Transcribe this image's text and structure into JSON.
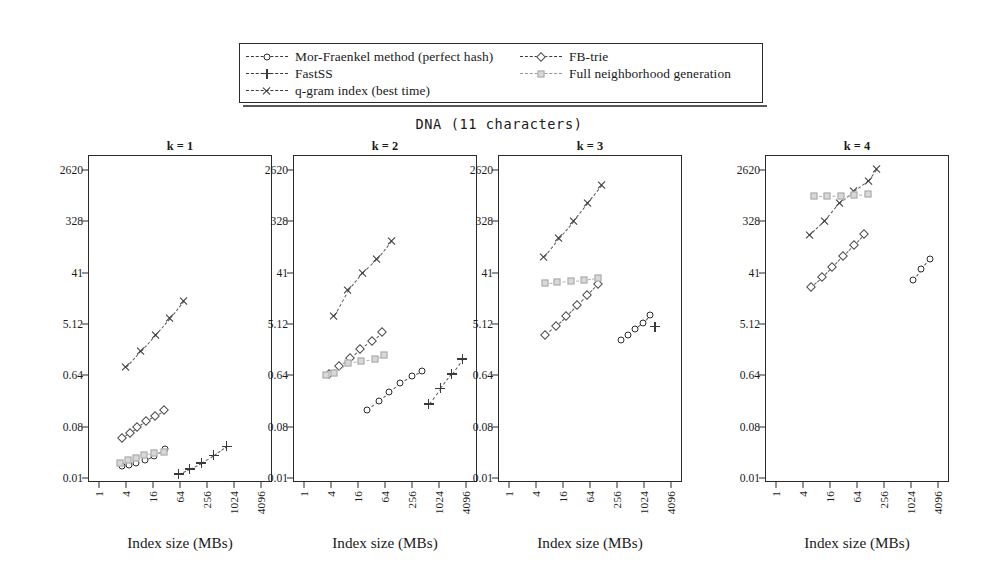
{
  "figure": {
    "title": "DNA (11 characters)",
    "xlabel": "Index size (MBs)"
  },
  "legend": {
    "entries_left": [
      {
        "label": "Mor-Fraenkel method (perfect hash)",
        "marker": "circle-marker",
        "line": "dashed-dark"
      },
      {
        "label": "FastSS",
        "marker": "plus-marker",
        "line": "dashed-dark"
      },
      {
        "label": "q-gram index (best time)",
        "marker": "cross-marker",
        "line": "dashed-dark"
      }
    ],
    "entries_right": [
      {
        "label": "FB-trie",
        "marker": "diamond-marker",
        "line": "dashed-dark"
      },
      {
        "label": "Full neighborhood generation",
        "marker": "square-marker",
        "line": "dashed-gray"
      }
    ]
  },
  "axes": {
    "y_ticks": [
      "2620",
      "328",
      "41",
      "5.12",
      "0.64",
      "0.08",
      "0.01"
    ],
    "y_values": [
      2620,
      328,
      41,
      5.12,
      0.64,
      0.08,
      0.01
    ],
    "x_ticks": [
      "1",
      "4",
      "16",
      "64",
      "256",
      "1024",
      "4096"
    ],
    "x_values": [
      1,
      4,
      16,
      64,
      256,
      1024,
      4096
    ]
  },
  "colors": {
    "frame": "#2b2b2b",
    "dark_series": "#3a3a3a",
    "gray_series": "#a8a8a8",
    "gray_fill": "#d8d8d8",
    "background": "#ffffff"
  },
  "chart_data": {
    "type": "scatter",
    "title": "DNA (11 characters)",
    "xlabel": "Index size (MBs)",
    "ylabel": "",
    "xscale": "log",
    "yscale": "log",
    "xlim": [
      1,
      4096
    ],
    "ylim": [
      0.01,
      2620
    ],
    "grid": false,
    "legend_position": "top-center",
    "panels": [
      {
        "label": "k = 1",
        "series": [
          {
            "name": "Mor-Fraenkel method (perfect hash)",
            "marker": "circle",
            "x": [
              3.2,
              4.6,
              6.8,
              10.5,
              17.0,
              30.0
            ],
            "y": [
              0.0165,
              0.017,
              0.0185,
              0.0205,
              0.0245,
              0.033
            ]
          },
          {
            "name": "FastSS",
            "marker": "plus",
            "x": [
              60.0,
              105.0,
              190.0,
              360.0,
              700.0
            ],
            "y": [
              0.0118,
              0.0145,
              0.0185,
              0.025,
              0.036
            ]
          },
          {
            "name": "q-gram index (best time)",
            "marker": "cross",
            "x": [
              4.0,
              8.5,
              18.0,
              38.0,
              78.0
            ],
            "y": [
              0.88,
              1.7,
              3.3,
              6.4,
              13.0
            ]
          },
          {
            "name": "FB-trie",
            "marker": "diamond",
            "x": [
              3.2,
              4.8,
              7.2,
              11.0,
              17.5,
              28.0
            ],
            "y": [
              0.05,
              0.063,
              0.08,
              0.1,
              0.125,
              0.155
            ]
          },
          {
            "name": "Full neighborhood generation",
            "marker": "square",
            "x": [
              2.9,
              4.4,
              6.6,
              10.2,
              16.5,
              28.0
            ],
            "y": [
              0.0185,
              0.0205,
              0.0225,
              0.025,
              0.0275,
              0.029
            ]
          }
        ]
      },
      {
        "label": "k = 2",
        "series": [
          {
            "name": "Mor-Fraenkel method (perfect hash)",
            "marker": "circle",
            "x": [
              26.0,
              46.0,
              80.0,
              140.0,
              250.0,
              430.0
            ],
            "y": [
              0.155,
              0.225,
              0.33,
              0.47,
              0.62,
              0.76
            ]
          },
          {
            "name": "FastSS",
            "marker": "plus",
            "x": [
              600.0,
              1100.0,
              1950.0,
              3400.0
            ],
            "y": [
              0.2,
              0.38,
              0.68,
              1.25
            ]
          },
          {
            "name": "q-gram index (best time)",
            "marker": "cross",
            "x": [
              4.6,
              9.5,
              20.0,
              42.0,
              88.0
            ],
            "y": [
              7.0,
              20.0,
              41.0,
              72.0,
              150.0
            ]
          },
          {
            "name": "FB-trie",
            "marker": "diamond",
            "x": [
              3.6,
              6.0,
              10.5,
              18.0,
              32.0,
              56.0
            ],
            "y": [
              0.68,
              0.95,
              1.3,
              1.85,
              2.6,
              3.7
            ]
          },
          {
            "name": "Full neighborhood generation",
            "marker": "square",
            "x": [
              3.1,
              4.6,
              9.5,
              19.0,
              38.0,
              62.0
            ],
            "y": [
              0.66,
              0.7,
              1.05,
              1.15,
              1.25,
              1.45
            ]
          }
        ]
      },
      {
        "label": "k = 3",
        "series": [
          {
            "name": "Mor-Fraenkel method (perfect hash)",
            "marker": "circle",
            "x": [
              310.0,
              450.0,
              660.0,
              960.0,
              1400.0
            ],
            "y": [
              2.7,
              3.3,
              4.1,
              5.3,
              7.4
            ]
          },
          {
            "name": "FastSS",
            "marker": "plus",
            "x": [
              1800.0
            ],
            "y": [
              4.6
            ]
          },
          {
            "name": "q-gram index (best time)",
            "marker": "cross",
            "x": [
              6.0,
              13.0,
              27.0,
              56.0,
              118.0
            ],
            "y": [
              78.0,
              170.0,
              330.0,
              680.0,
              1400.0
            ]
          },
          {
            "name": "FB-trie",
            "marker": "diamond",
            "x": [
              6.5,
              11.0,
              19.0,
              33.0,
              56.0,
              96.0
            ],
            "y": [
              3.3,
              4.8,
              7.2,
              11.0,
              16.5,
              26.0
            ]
          },
          {
            "name": "Full neighborhood generation",
            "marker": "square",
            "x": [
              6.5,
              12.0,
              24.0,
              46.0,
              96.0
            ],
            "y": [
              27.0,
              27.5,
              29.0,
              30.0,
              33.0
            ]
          }
        ]
      },
      {
        "label": "k = 4",
        "series": [
          {
            "name": "Mor-Fraenkel method (perfect hash)",
            "marker": "circle",
            "x": [
              1150.0,
              1750.0,
              2700.0
            ],
            "y": [
              31.0,
              47.0,
              72.0
            ]
          },
          {
            "name": "FastSS",
            "marker": "plus",
            "x": [],
            "y": []
          },
          {
            "name": "q-gram index (best time)",
            "marker": "cross",
            "x": [
              5.5,
              12.0,
              26.0,
              55.0,
              115.0,
              175.0
            ],
            "y": [
              185.0,
              330.0,
              700.0,
              1100.0,
              1700.0,
              2700.0
            ]
          },
          {
            "name": "FB-trie",
            "marker": "diamond",
            "x": [
              6.0,
              10.5,
              18.0,
              31.0,
              54.0,
              92.0
            ],
            "y": [
              23.0,
              34.0,
              52.0,
              82.0,
              128.0,
              200.0
            ]
          },
          {
            "name": "Full neighborhood generation",
            "marker": "square",
            "x": [
              7.0,
              14.0,
              28.0,
              56.0,
              110.0
            ],
            "y": [
              900.0,
              900.0,
              920.0,
              950.0,
              980.0
            ]
          }
        ]
      }
    ]
  }
}
